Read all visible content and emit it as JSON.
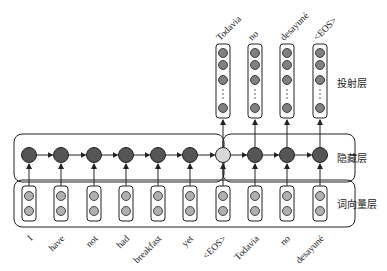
{
  "layers": {
    "projection": "投射层",
    "hidden": "隐藏层",
    "embedding": "词向量层"
  },
  "input_tokens": [
    "I",
    "have",
    "not",
    "had",
    "breakfast",
    "yet",
    "<EOS>",
    "Todavia",
    "no",
    "desayuné"
  ],
  "output_tokens": [
    "Todavia",
    "no",
    "desayuné",
    "<EOS>"
  ],
  "colors": {
    "hidden_node": "#555555",
    "eos_node": "#d8d8d8",
    "embed_node": "#b0b0b0",
    "proj_node": "#808080",
    "stroke": "#222222"
  }
}
